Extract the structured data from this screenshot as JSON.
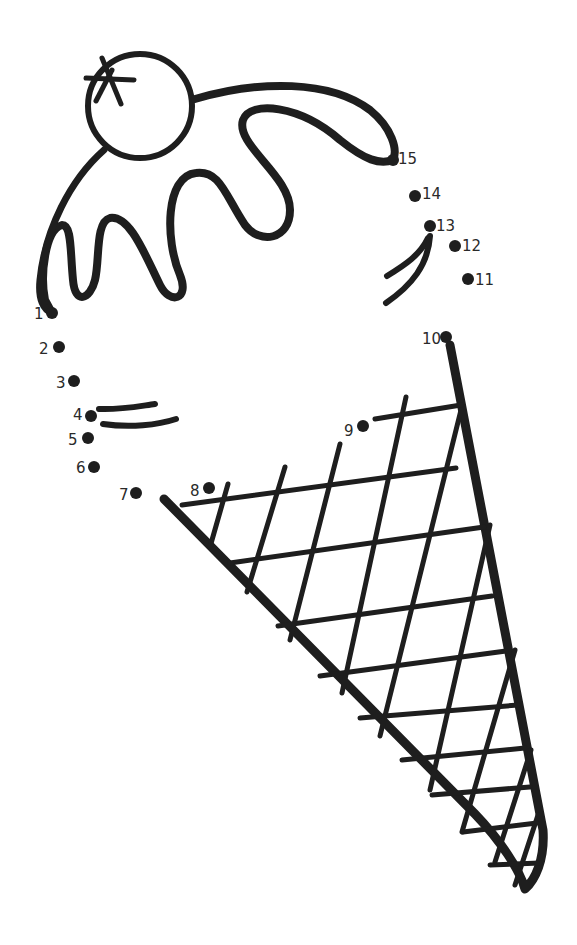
{
  "worksheet": {
    "subject": "ice cream cone",
    "ink_color": "#1e1e1e",
    "background": "#ffffff",
    "dots": [
      {
        "n": "1",
        "x": 52,
        "y": 313,
        "lx": 34,
        "ly": 319
      },
      {
        "n": "2",
        "x": 59,
        "y": 347,
        "lx": 39,
        "ly": 354
      },
      {
        "n": "3",
        "x": 74,
        "y": 381,
        "lx": 56,
        "ly": 388
      },
      {
        "n": "4",
        "x": 91,
        "y": 416,
        "lx": 73,
        "ly": 420
      },
      {
        "n": "5",
        "x": 88,
        "y": 438,
        "lx": 68,
        "ly": 445
      },
      {
        "n": "6",
        "x": 94,
        "y": 467,
        "lx": 76,
        "ly": 473
      },
      {
        "n": "7",
        "x": 136,
        "y": 493,
        "lx": 119,
        "ly": 500
      },
      {
        "n": "8",
        "x": 209,
        "y": 488,
        "lx": 190,
        "ly": 496
      },
      {
        "n": "9",
        "x": 363,
        "y": 426,
        "lx": 344,
        "ly": 436
      },
      {
        "n": "10",
        "x": 446,
        "y": 337,
        "lx": 422,
        "ly": 344
      },
      {
        "n": "11",
        "x": 468,
        "y": 279,
        "lx": 475,
        "ly": 285
      },
      {
        "n": "12",
        "x": 455,
        "y": 246,
        "lx": 462,
        "ly": 251
      },
      {
        "n": "13",
        "x": 430,
        "y": 226,
        "lx": 436,
        "ly": 231
      },
      {
        "n": "14",
        "x": 415,
        "y": 196,
        "lx": 422,
        "ly": 199
      },
      {
        "n": "15",
        "x": 393,
        "y": 160,
        "lx": 398,
        "ly": 164
      }
    ]
  }
}
